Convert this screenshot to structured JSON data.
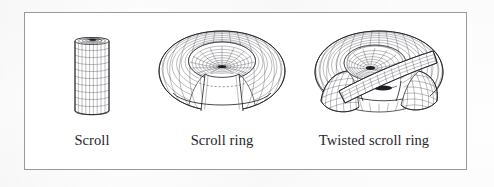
{
  "figure": {
    "border_color": "#9a9a9c",
    "background_color": "#ffffff",
    "ink_color": "#23232a",
    "panels": [
      {
        "id": "scroll",
        "caption": "Scroll",
        "shape": "open rolled cylindrical sheet (scroll) rendered as a quadrilateral wire mesh, vertical axis, spiral cross-section visible at the top opening"
      },
      {
        "id": "scroll-ring",
        "caption": "Scroll ring",
        "shape": "scroll surface bent into a closed torus ring; mesh-ruled, spiral funnel visible through the central hole, wedge cut away at the front revealing the inner scroll layers"
      },
      {
        "id": "twisted-scroll-ring",
        "caption": "Twisted scroll ring",
        "shape": "scroll ring with a half twist; a ruled ribbon crosses diagonally over the torus and two flared lobes open toward the viewer"
      }
    ]
  }
}
